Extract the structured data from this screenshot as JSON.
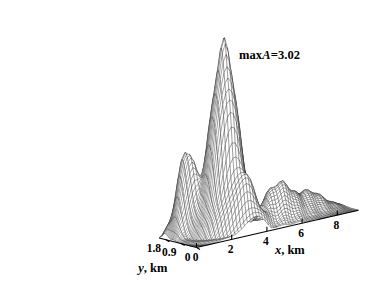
{
  "chart_data": {
    "type": "surface",
    "title": "",
    "xlabel": "x, km",
    "ylabel": "y, km",
    "zlabel": "",
    "xlim": [
      0,
      9.2
    ],
    "ylim": [
      0,
      2.2
    ],
    "zlim": [
      0,
      3.02
    ],
    "x_ticks": [
      "0",
      "2",
      "4",
      "6",
      "8"
    ],
    "x_tick_values": [
      0,
      2,
      4,
      6,
      8
    ],
    "y_ticks": [
      "0",
      "0.9",
      "1.8"
    ],
    "y_tick_values": [
      0,
      0.9,
      1.8
    ],
    "grid": false,
    "legend": false,
    "mesh_nx": 54,
    "mesh_ny": 44,
    "annotations": [
      {
        "name": "max-amplitude-annotation",
        "prefix": "max",
        "symbol": "A",
        "equals": "=",
        "value": "3.02",
        "text": "maxA=3.02"
      }
    ],
    "peaks": [
      {
        "name": "main-peak",
        "x": 2.55,
        "y": 1.02,
        "z": 3.02,
        "sx": 0.95,
        "sy": 0.52
      },
      {
        "name": "left-shoulder",
        "x": 1.05,
        "y": 1.7,
        "z": 1.32,
        "sx": 0.62,
        "sy": 0.4
      },
      {
        "name": "right-ridge",
        "x": 5.35,
        "y": 0.72,
        "z": 0.62,
        "sx": 1.15,
        "sy": 0.42
      },
      {
        "name": "far-ridge",
        "x": 7.3,
        "y": 1.05,
        "z": 0.34,
        "sx": 1.2,
        "sy": 0.46
      },
      {
        "name": "front-lobe",
        "x": 3.3,
        "y": 0.28,
        "z": 0.55,
        "sx": 0.8,
        "sy": 0.3
      }
    ],
    "ripple": {
      "amplitude": 0.085,
      "wavelength_x": 0.78,
      "decay": 0.3,
      "center_x": 2.55,
      "center_y": 1.02
    }
  },
  "colors": {
    "background": "#ffffff",
    "mesh": "#111111",
    "axis": "#000000",
    "text": "#000000"
  }
}
